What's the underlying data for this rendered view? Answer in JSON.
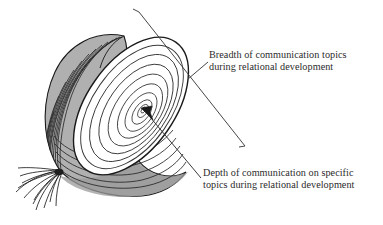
{
  "figure": {
    "kind": "onion-diagram",
    "title_present": false,
    "background_color": "#ffffff",
    "ink_color": "#231f20",
    "body_fill_color": "#b0b0b0",
    "body_shade_color": "#9a9a9a",
    "cut_face_fill_color": "#ffffff",
    "ring_stroke_color": "#3a3a3a",
    "outline_stroke_color": "#1a1a1a",
    "ring_count": 9,
    "parts": {
      "cut_face_label": "onion cut face with concentric rings",
      "body_label": "onion outer body with longitudinal layer lines",
      "roots_label": "onion root fibers",
      "center_label": "onion core"
    }
  },
  "annotations": {
    "breadth": {
      "line1": "Breadth of communication topics",
      "line2": "during relational development",
      "pointer_kind": "bracket-with-leader"
    },
    "depth": {
      "line1": "Depth of communication on specific",
      "line2": "topics during relational development",
      "pointer_kind": "arrow-to-center"
    }
  }
}
